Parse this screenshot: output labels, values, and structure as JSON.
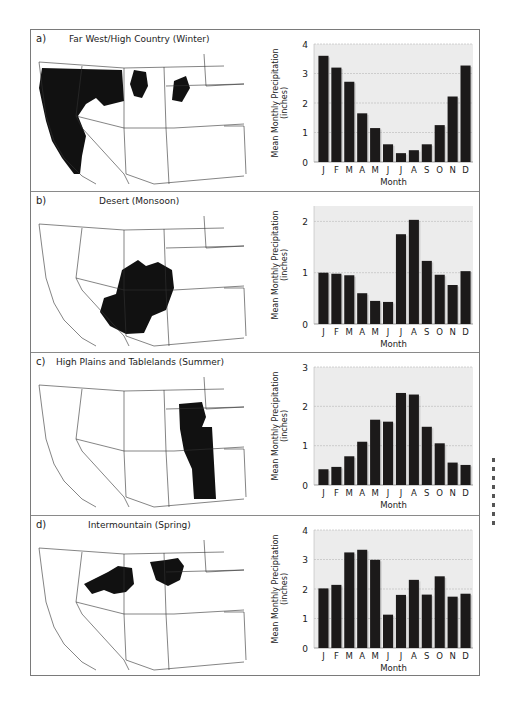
{
  "figure": {
    "panels": [
      {
        "letter": "a)",
        "title": "Far West/High Country (Winter)"
      },
      {
        "letter": "b)",
        "title": "Desert (Monsoon)"
      },
      {
        "letter": "c)",
        "title": "High Plains and Tablelands (Summer)"
      },
      {
        "letter": "d)",
        "title": "Intermountain (Spring)"
      }
    ],
    "colors": {
      "bar": "#1c1a1a",
      "plot_bg": "#ececec",
      "grid": "#b8b8b8",
      "region": "#111111"
    }
  },
  "chart_data": [
    {
      "type": "bar",
      "title": "Far West/High Country (Winter)",
      "categories": [
        "J",
        "F",
        "M",
        "A",
        "M",
        "J",
        "J",
        "A",
        "S",
        "O",
        "N",
        "D"
      ],
      "values": [
        3.6,
        3.2,
        2.72,
        1.65,
        1.15,
        0.6,
        0.3,
        0.4,
        0.6,
        1.25,
        2.22,
        3.27
      ],
      "xlabel": "Month",
      "ylabel": "Mean Monthly Precipitation (inches)",
      "ylabel_lines": [
        "Mean Monthly Precipitation",
        "(inches)"
      ],
      "ylim": [
        0,
        4
      ],
      "yticks": [
        0,
        1,
        2,
        3,
        4
      ],
      "grid": true
    },
    {
      "type": "bar",
      "title": "Desert (Monsoon)",
      "categories": [
        "J",
        "F",
        "M",
        "A",
        "M",
        "J",
        "J",
        "A",
        "S",
        "O",
        "N",
        "D"
      ],
      "values": [
        1.0,
        0.98,
        0.95,
        0.6,
        0.45,
        0.43,
        1.75,
        2.03,
        1.23,
        0.96,
        0.76,
        1.03
      ],
      "xlabel": "Month",
      "ylabel": "Mean Monthly Precipitation (inches)",
      "ylabel_lines": [
        "Mean Monthly Precipitation",
        "(inches)"
      ],
      "ylim": [
        0,
        2.3
      ],
      "yticks": [
        0,
        1,
        2
      ],
      "grid": true
    },
    {
      "type": "bar",
      "title": "High Plains and Tablelands (Summer)",
      "categories": [
        "J",
        "F",
        "M",
        "A",
        "M",
        "J",
        "J",
        "A",
        "S",
        "O",
        "N",
        "D"
      ],
      "values": [
        0.4,
        0.46,
        0.73,
        1.1,
        1.66,
        1.61,
        2.34,
        2.3,
        1.48,
        1.06,
        0.57,
        0.51
      ],
      "xlabel": "Month",
      "ylabel": "Mean Monthly Precipitation (inches)",
      "ylabel_lines": [
        "Mean Monthly Precipitation",
        "(inches)"
      ],
      "ylim": [
        0,
        3
      ],
      "yticks": [
        0,
        1,
        2,
        3
      ],
      "grid": true
    },
    {
      "type": "bar",
      "title": "Intermountain (Spring)",
      "categories": [
        "J",
        "F",
        "M",
        "A",
        "M",
        "J",
        "J",
        "A",
        "S",
        "O",
        "N",
        "D"
      ],
      "values": [
        2.02,
        2.14,
        3.24,
        3.33,
        2.99,
        1.13,
        1.8,
        2.31,
        1.81,
        2.43,
        1.74,
        1.84
      ],
      "xlabel": "Month",
      "ylabel": "Mean Monthly Precipitation (inches)",
      "ylabel_lines": [
        "Mean Monthly Precipitation",
        "(inches)"
      ],
      "ylim": [
        0,
        4
      ],
      "yticks": [
        0,
        1,
        2,
        3,
        4
      ],
      "grid": true
    }
  ]
}
